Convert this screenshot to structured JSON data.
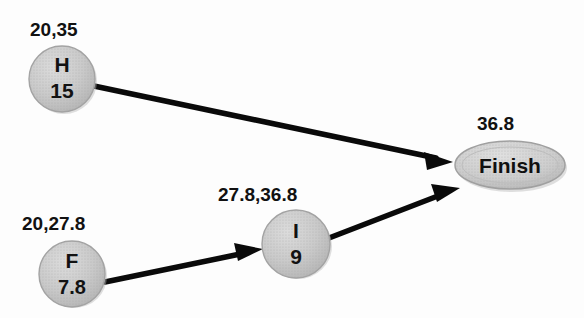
{
  "diagram": {
    "background_color": "#fdfdfd",
    "node_fill_color": "#c9c9c9",
    "node_stroke_color": "#9a9a9a",
    "edge_color": "#0a0a0a",
    "text_color": "#111111",
    "nodes": [
      {
        "id": "H",
        "shape": "circle",
        "name": "H",
        "duration": "15",
        "time_label": "20,35",
        "cx": 62,
        "cy": 79,
        "r": 33
      },
      {
        "id": "F",
        "shape": "circle",
        "name": "F",
        "duration": "7.8",
        "time_label": "20,27.8",
        "cx": 72,
        "cy": 274,
        "r": 33
      },
      {
        "id": "I",
        "shape": "circle",
        "name": "I",
        "duration": "9",
        "time_label": "27.8,36.8",
        "cx": 296,
        "cy": 244,
        "r": 34
      },
      {
        "id": "Finish",
        "shape": "ellipse",
        "name": "Finish",
        "duration": "",
        "time_label": "36.8",
        "cx": 510,
        "cy": 165,
        "rx": 55,
        "ry": 24
      }
    ],
    "edges": [
      {
        "id": "edge-h-finish",
        "from": "H",
        "to": "Finish"
      },
      {
        "id": "edge-f-i",
        "from": "F",
        "to": "I"
      },
      {
        "id": "edge-i-finish",
        "from": "I",
        "to": "Finish"
      }
    ]
  }
}
